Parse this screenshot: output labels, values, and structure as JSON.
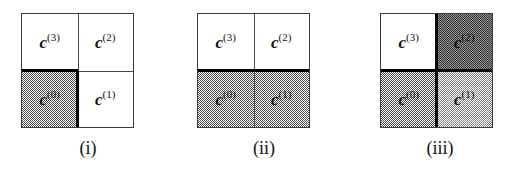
{
  "figure": {
    "panels": [
      {
        "id": "panel-i",
        "caption": "(i)",
        "quadrants": {
          "top_left": {
            "label": "c",
            "superscript": "(3)",
            "fill": "white"
          },
          "top_right": {
            "label": "c",
            "superscript": "(2)",
            "fill": "white"
          },
          "bottom_left": {
            "label": "c",
            "superscript": "(0)",
            "fill": "gray"
          },
          "bottom_right": {
            "label": "c",
            "superscript": "(1)",
            "fill": "white"
          }
        },
        "edges": {
          "horizontal_mid": "thick-solid-left-half",
          "vertical_mid": "thick-solid-bottom-half",
          "vertical_mid_top": "thin-solid",
          "horizontal_mid_right": "thin-solid"
        }
      },
      {
        "id": "panel-ii",
        "caption": "(ii)",
        "quadrants": {
          "top_left": {
            "label": "c",
            "superscript": "(3)",
            "fill": "white"
          },
          "top_right": {
            "label": "c",
            "superscript": "(2)",
            "fill": "white"
          },
          "bottom_left": {
            "label": "c",
            "superscript": "(0)",
            "fill": "gray"
          },
          "bottom_right": {
            "label": "c",
            "superscript": "(1)",
            "fill": "gray"
          }
        },
        "edges": {
          "horizontal_mid": "thick-solid-full",
          "vertical_mid": "thin-solid-full"
        }
      },
      {
        "id": "panel-iii",
        "caption": "(iii)",
        "quadrants": {
          "top_left": {
            "label": "c",
            "superscript": "(3)",
            "fill": "white"
          },
          "top_right": {
            "label": "c",
            "superscript": "(2)",
            "fill": "gray-dark"
          },
          "bottom_left": {
            "label": "c",
            "superscript": "(0)",
            "fill": "gray"
          },
          "bottom_right": {
            "label": "c",
            "superscript": "(1)",
            "fill": "gray-light"
          }
        },
        "edges": {
          "horizontal_mid_left": "thick-solid",
          "vertical_mid_top": "thick-solid",
          "horizontal_mid_right": "thick-dashed",
          "vertical_mid_bottom": "thick-dashed"
        }
      }
    ],
    "colors": {
      "outline": "#3a3a3a",
      "thick_line": "#000000",
      "dash_line": "#000000",
      "fill_white": "#ffffff",
      "fill_gray": "#9a9a9a",
      "fill_gray_dark": "#6e6e6e",
      "fill_gray_light": "#c0c0c0",
      "text": "#111111"
    }
  }
}
